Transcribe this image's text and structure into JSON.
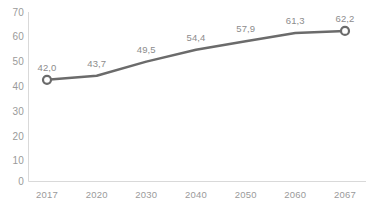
{
  "chart_data": {
    "type": "line",
    "title": "",
    "subtitle": "",
    "xlabel": "",
    "ylabel": "",
    "categories": [
      "2017",
      "2020",
      "2030",
      "2040",
      "2050",
      "2060",
      "2067"
    ],
    "values": [
      42.0,
      43.7,
      49.5,
      54.4,
      57.9,
      61.3,
      62.2
    ],
    "data_labels": [
      "42,0",
      "43,7",
      "49,5",
      "54,4",
      "57,9",
      "61,3",
      "62,2"
    ],
    "ylim": [
      0,
      70
    ],
    "y_ticks": [
      0,
      10,
      20,
      30,
      40,
      50,
      60,
      70
    ],
    "y_tick_labels": [
      "0",
      "10",
      "20",
      "30",
      "40",
      "50",
      "60",
      "70"
    ],
    "grid": false,
    "legend": false,
    "legend_position": "none",
    "decimal_separator": ",",
    "markers": {
      "shown_at": [
        "first",
        "last"
      ],
      "shape": "circle",
      "fill_color": "#ffffff",
      "edge_color": "#6b6b6b"
    },
    "series": [
      {
        "name": "series-1",
        "values": [
          42.0,
          43.7,
          49.5,
          54.4,
          57.9,
          61.3,
          62.2
        ],
        "line_color": "#6b6b6b",
        "line_width": 2.5
      }
    ],
    "colors": {
      "line": "#6b6b6b",
      "axis": "#d9d9d9",
      "tick_label": "#9a9a9a",
      "data_label": "#8c8c8c",
      "background": "#ffffff"
    }
  }
}
